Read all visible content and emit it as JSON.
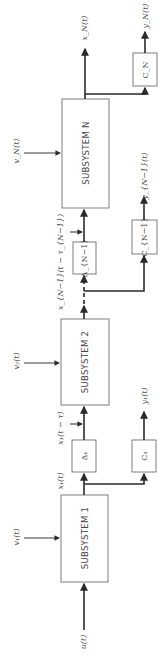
{
  "diagram": {
    "orientation": "rotated-90-ccw",
    "subsystems": [
      {
        "id": "s1",
        "label": "SUBSYSTEM 1"
      },
      {
        "id": "s2",
        "label": "SUBSYSTEM 2"
      },
      {
        "id": "sN",
        "label": "SUBSYSTEM N"
      }
    ],
    "delay_blocks": [
      {
        "id": "d1",
        "label": "Δ₁"
      },
      {
        "id": "dN1",
        "label": "Δ_{N−1}"
      }
    ],
    "output_blocks": [
      {
        "id": "c1",
        "label": "C₁"
      },
      {
        "id": "cN1",
        "label": "C_{N−1}"
      },
      {
        "id": "cN",
        "label": "C_N"
      }
    ],
    "signals": {
      "u": "u(t)",
      "v1": "v₁(t)",
      "v2": "v₂(t)",
      "vN": "v_N(t)",
      "x1": "x₁(t)",
      "x1_delayed": "x₁(t − τ)",
      "xN1_delayed": "x_{N−1}(t − τ_{N−1})",
      "xN": "x_N(t)",
      "y1": "y₁(t)",
      "yN1": "y_{N−1}(t)",
      "yN": "y_N(t)"
    }
  }
}
